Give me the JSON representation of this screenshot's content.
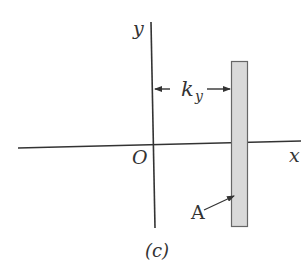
{
  "figure": {
    "caption": "(c)",
    "labels": {
      "y_axis": "y",
      "x_axis": "x",
      "origin": "O",
      "distance_main": "k",
      "distance_sub": "y",
      "area": "A"
    }
  },
  "colors": {
    "axis": "#333333",
    "rect_fill": "#d9d9d9",
    "rect_stroke": "#666666",
    "text": "#333333"
  }
}
